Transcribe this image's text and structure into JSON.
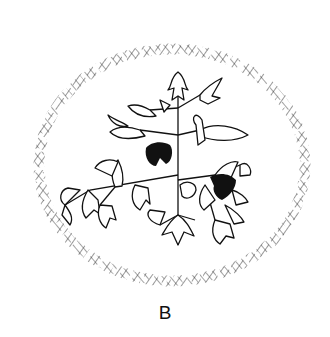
{
  "figure": {
    "panel_label": "B",
    "colors": {
      "ink": "#111111",
      "background": "#ffffff",
      "hatch": "#444444"
    }
  }
}
